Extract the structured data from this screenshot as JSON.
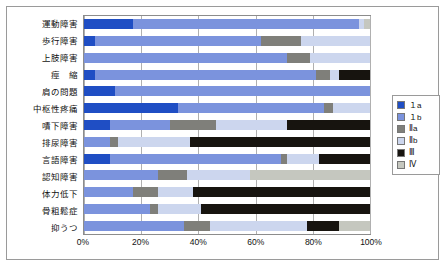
{
  "chart_data": {
    "type": "bar",
    "orientation": "horizontal",
    "stacked": true,
    "normalized": true,
    "title": "",
    "xlabel": "",
    "ylabel": "",
    "xlim": [
      0,
      100
    ],
    "xticks": [
      "0%",
      "20%",
      "40%",
      "60%",
      "80%",
      "100%"
    ],
    "xtick_values": [
      0,
      20,
      40,
      60,
      80,
      100
    ],
    "grid": true,
    "legend_position": "right",
    "categories": [
      "運動障害",
      "歩行障害",
      "上肢障害",
      "痙　縮",
      "肩の問題",
      "中枢性疼痛",
      "嘖下障害",
      "排尿障害",
      "言語障害",
      "認知障害",
      "体力低下",
      "骨粗鬆症",
      "抑うつ"
    ],
    "series": [
      {
        "name": "1a",
        "color": "#1f4ec4",
        "values": [
          17,
          4,
          0,
          4,
          11,
          33,
          9,
          0,
          9,
          0,
          0,
          0,
          0
        ]
      },
      {
        "name": "1b",
        "color": "#7b93dd",
        "values": [
          79,
          58,
          71,
          77,
          89,
          51,
          21,
          9,
          60,
          26,
          17,
          23,
          35
        ]
      },
      {
        "name": "Ⅱa",
        "color": "#7f7f7a",
        "values": [
          0,
          14,
          8,
          5,
          0,
          3,
          16,
          3,
          2,
          10,
          9,
          3,
          9
        ]
      },
      {
        "name": "Ⅱb",
        "color": "#ccd6ee",
        "values": [
          2,
          24,
          21,
          3,
          0,
          13,
          25,
          25,
          11,
          22,
          12,
          15,
          34
        ]
      },
      {
        "name": "Ⅲ",
        "color": "#17140f",
        "values": [
          0,
          0,
          0,
          11,
          0,
          0,
          29,
          63,
          18,
          0,
          62,
          59,
          11
        ]
      },
      {
        "name": "Ⅳ",
        "color": "#c5c7bf",
        "values": [
          2,
          0,
          0,
          0,
          0,
          0,
          0,
          0,
          0,
          42,
          0,
          0,
          11
        ]
      }
    ]
  },
  "legend": {
    "items": [
      {
        "label": "１a",
        "color": "#1f4ec4"
      },
      {
        "label": "１b",
        "color": "#7b93dd"
      },
      {
        "label": "Ⅱa",
        "color": "#7f7f7a"
      },
      {
        "label": "Ⅱb",
        "color": "#ccd6ee"
      },
      {
        "label": "Ⅲ",
        "color": "#17140f"
      },
      {
        "label": "Ⅳ",
        "color": "#c5c7bf"
      }
    ]
  }
}
